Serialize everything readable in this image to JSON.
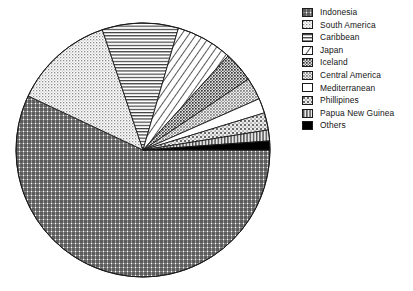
{
  "chart_data": {
    "type": "pie",
    "title": "",
    "subtitle": "",
    "xlabel": "",
    "ylabel": "",
    "legend_position": "right",
    "grid": false,
    "units": "percent",
    "start_angle_deg": 0,
    "direction": "clockwise",
    "categories": [
      "Indonesia",
      "South America",
      "Caribbean",
      "Japan",
      "Iceland",
      "Central America",
      "Mediterranean",
      "Phillipines",
      "Papua New Guinea",
      "Others"
    ],
    "values": [
      57.0,
      12.8,
      9.7,
      7.2,
      3.9,
      2.8,
      1.9,
      2.2,
      1.4,
      1.1
    ],
    "angles_deg": [
      205.2,
      46.1,
      34.9,
      25.9,
      14.0,
      10.1,
      6.8,
      7.9,
      5.0,
      4.1
    ],
    "slices": [
      {
        "label": "Indonesia",
        "value": 57.0,
        "angle_deg": 205.2,
        "pattern": "cross-hatch-fine",
        "color": "#3c3c3c"
      },
      {
        "label": "South America",
        "value": 12.8,
        "angle_deg": 46.1,
        "pattern": "stipple-light",
        "color": "#a8a8a8"
      },
      {
        "label": "Caribbean",
        "value": 9.7,
        "angle_deg": 34.9,
        "pattern": "horizontal-lines",
        "color": "#2b2b2b"
      },
      {
        "label": "Japan",
        "value": 7.2,
        "angle_deg": 25.9,
        "pattern": "diagonal-hatch",
        "color": "#2b2b2b"
      },
      {
        "label": "Iceland",
        "value": 3.9,
        "angle_deg": 14.0,
        "pattern": "stipple-dark",
        "color": "#585858"
      },
      {
        "label": "Central America",
        "value": 2.8,
        "angle_deg": 10.1,
        "pattern": "stipple-medium",
        "color": "#6e6e6e"
      },
      {
        "label": "Mediterranean",
        "value": 1.9,
        "angle_deg": 6.8,
        "pattern": "solid-white",
        "color": "#ffffff"
      },
      {
        "label": "Phillipines",
        "value": 2.2,
        "angle_deg": 7.9,
        "pattern": "stipple-coarse",
        "color": "#777777"
      },
      {
        "label": "Papua New Guinea",
        "value": 1.4,
        "angle_deg": 5.0,
        "pattern": "vertical-lines",
        "color": "#4a4a4a"
      },
      {
        "label": "Others",
        "value": 1.1,
        "angle_deg": 4.1,
        "pattern": "solid-black",
        "color": "#000000"
      }
    ],
    "geometry": {
      "cx": 143,
      "cy": 150,
      "r": 127
    }
  },
  "legend": {
    "items": [
      {
        "label": "Indonesia",
        "swatch": "cross-hatch-fine"
      },
      {
        "label": "South America",
        "swatch": "stipple-light"
      },
      {
        "label": "Caribbean",
        "swatch": "horizontal-lines"
      },
      {
        "label": "Japan",
        "swatch": "diagonal-hatch"
      },
      {
        "label": "Iceland",
        "swatch": "stipple-dark"
      },
      {
        "label": "Central America",
        "swatch": "stipple-medium"
      },
      {
        "label": "Mediterranean",
        "swatch": "solid-white"
      },
      {
        "label": "Phillipines",
        "swatch": "stipple-coarse"
      },
      {
        "label": "Papua New Guinea",
        "swatch": "vertical-lines"
      },
      {
        "label": "Others",
        "swatch": "solid-black"
      }
    ]
  }
}
